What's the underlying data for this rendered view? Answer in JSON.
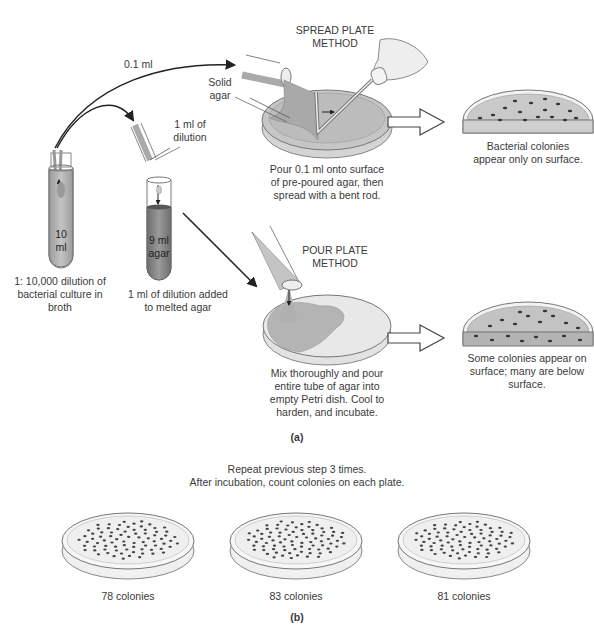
{
  "part_a": {
    "label": "(a)",
    "transfer_labels": {
      "spread_volume": "0.1 ml",
      "pour_volume_line1": "1 ml of",
      "pour_volume_line2": "dilution"
    },
    "tube1": {
      "volume_line1": "10",
      "volume_line2": "ml",
      "caption_line1": "1: 10,000 dilution of",
      "caption_line2": "bacterial culture in",
      "caption_line3": "broth"
    },
    "tube2": {
      "volume_line1": "9 ml",
      "volume_line2": "agar",
      "caption_line1": "1 ml of dilution added",
      "caption_line2": "to melted agar"
    },
    "spread_plate": {
      "title_line1": "SPREAD PLATE",
      "title_line2": "METHOD",
      "agar_label_line1": "Solid",
      "agar_label_line2": "agar",
      "caption_line1": "Pour 0.1 ml onto surface",
      "caption_line2": "of pre-poured agar, then",
      "caption_line3": "spread with a bent rod.",
      "result_line1": "Bacterial colonies",
      "result_line2": "appear only on surface."
    },
    "pour_plate": {
      "title_line1": "POUR PLATE",
      "title_line2": "METHOD",
      "caption_line1": "Mix thoroughly and pour",
      "caption_line2": "entire tube of agar into",
      "caption_line3": "empty Petri dish. Cool to",
      "caption_line4": "harden, and incubate.",
      "result_line1": "Some colonies appear on",
      "result_line2": "surface; many are below",
      "result_line3": "surface."
    }
  },
  "part_b": {
    "label": "(b)",
    "instruction_line1": "Repeat previous step 3 times.",
    "instruction_line2": "After incubation, count colonies on each plate.",
    "plates": [
      {
        "count_label": "78 colonies",
        "count": 78
      },
      {
        "count_label": "83 colonies",
        "count": 83
      },
      {
        "count_label": "81 colonies",
        "count": 81
      }
    ]
  },
  "colors": {
    "agar": "#b8b8b8",
    "agar_dark": "#8f8f8f",
    "colony": "#3a3a3a",
    "line": "#555555"
  }
}
